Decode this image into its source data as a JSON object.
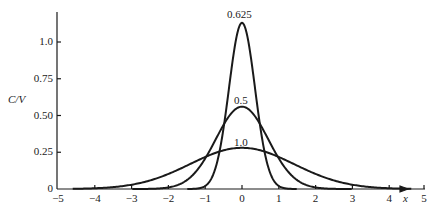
{
  "chart_data": {
    "type": "line",
    "title": "",
    "xlabel": "x",
    "ylabel": "C/V",
    "xlim": [
      -5,
      5
    ],
    "ylim": [
      0,
      1.2
    ],
    "grid": false,
    "legend": "inline curve labels at peaks",
    "x_ticks": [
      "-5",
      "-4",
      "-3",
      "-2",
      "-1",
      "0",
      "1",
      "2",
      "3",
      "4",
      "5"
    ],
    "y_ticks": [
      "0",
      "0.25",
      "0.50",
      "0.75",
      "1.0"
    ],
    "series": [
      {
        "name": "0.625",
        "label": "0.625",
        "shape": "gaussian",
        "mean": 0,
        "sigma": 0.354,
        "peak": 1.13
      },
      {
        "name": "0.5",
        "label": "0.5",
        "shape": "gaussian",
        "mean": 0,
        "sigma": 0.71,
        "peak": 0.56
      },
      {
        "name": "1.0",
        "label": "1.0",
        "shape": "gaussian",
        "mean": 0,
        "sigma": 1.41,
        "peak": 0.28
      }
    ]
  },
  "axes": {
    "ylabel": "C/V",
    "xlabel": "x",
    "y_ticks": [
      {
        "label": "1.0",
        "value": 1.0
      },
      {
        "label": "0.75",
        "value": 0.75
      },
      {
        "label": "0.50",
        "value": 0.5
      },
      {
        "label": "0.25",
        "value": 0.25
      },
      {
        "label": "0",
        "value": 0
      }
    ],
    "x_ticks": [
      {
        "label": "−5",
        "value": -5
      },
      {
        "label": "−4",
        "value": -4
      },
      {
        "label": "−3",
        "value": -3
      },
      {
        "label": "−2",
        "value": -2
      },
      {
        "label": "−1",
        "value": -1
      },
      {
        "label": "0",
        "value": 0
      },
      {
        "label": "1",
        "value": 1
      },
      {
        "label": "2",
        "value": 2
      },
      {
        "label": "3",
        "value": 3
      },
      {
        "label": "4",
        "value": 4
      },
      {
        "label": "5",
        "value": 5
      }
    ]
  },
  "curve_labels": {
    "c1": "0.625",
    "c2": "0.5",
    "c3": "1.0"
  }
}
